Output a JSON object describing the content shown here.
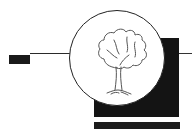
{
  "logo": {
    "description": "tree emblem",
    "colors": {
      "background": "#ffffff",
      "shapes": "#141414",
      "circle_fill": "#ffffff",
      "circle_stroke": "#222222",
      "tree_stroke": "#555555"
    },
    "icon": "tree-icon"
  }
}
